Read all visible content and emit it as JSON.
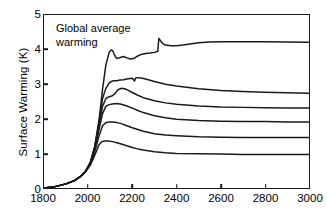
{
  "chart_data": {
    "type": "line",
    "title": "",
    "annotation": "Global average\nwarming",
    "xlabel": "",
    "ylabel": "Surface Warming (K)",
    "xlim": [
      1800,
      3000
    ],
    "ylim": [
      0,
      5
    ],
    "xticks": [
      1800,
      2000,
      2200,
      2400,
      2600,
      2800,
      3000
    ],
    "yticks": [
      0,
      1,
      2,
      3,
      4,
      5
    ],
    "grid": false,
    "legend": "none",
    "line_color": "#1a1a1a",
    "series": [
      {
        "name": "Scenario 1 (highest)",
        "x": [
          1800,
          1850,
          1900,
          1940,
          1970,
          1990,
          2010,
          2030,
          2050,
          2065,
          2080,
          2095,
          2105,
          2112,
          2120,
          2130,
          2145,
          2160,
          2175,
          2190,
          2205,
          2220,
          2240,
          2260,
          2280,
          2300,
          2315,
          2320,
          2325,
          2335,
          2350,
          2375,
          2400,
          2430,
          2460,
          2500,
          2550,
          2600,
          2700,
          2800,
          2900,
          3000
        ],
        "values": [
          0.0,
          0.04,
          0.12,
          0.22,
          0.36,
          0.5,
          0.74,
          1.2,
          2.0,
          2.85,
          3.55,
          3.92,
          3.99,
          3.96,
          3.83,
          3.74,
          3.77,
          3.8,
          3.76,
          3.73,
          3.74,
          3.8,
          3.86,
          3.89,
          3.9,
          3.92,
          3.95,
          4.32,
          4.28,
          4.19,
          4.13,
          4.11,
          4.11,
          4.13,
          4.16,
          4.2,
          4.22,
          4.23,
          4.23,
          4.23,
          4.22,
          4.21
        ]
      },
      {
        "name": "Scenario 2",
        "x": [
          1800,
          1850,
          1900,
          1940,
          1970,
          1990,
          2010,
          2030,
          2050,
          2065,
          2080,
          2095,
          2105,
          2115,
          2130,
          2145,
          2160,
          2180,
          2200,
          2210,
          2215,
          2225,
          2240,
          2260,
          2300,
          2350,
          2400,
          2500,
          2600,
          2700,
          2800,
          2900,
          3000
        ],
        "values": [
          0.0,
          0.04,
          0.12,
          0.22,
          0.36,
          0.5,
          0.74,
          1.2,
          1.95,
          2.58,
          2.88,
          3.03,
          3.08,
          3.1,
          3.1,
          3.12,
          3.13,
          3.16,
          3.17,
          3.09,
          3.18,
          3.19,
          3.18,
          3.15,
          3.08,
          3.0,
          2.95,
          2.87,
          2.82,
          2.79,
          2.77,
          2.75,
          2.74
        ]
      },
      {
        "name": "Scenario 3",
        "x": [
          1800,
          1850,
          1900,
          1940,
          1970,
          1990,
          2010,
          2030,
          2050,
          2065,
          2080,
          2095,
          2108,
          2120,
          2135,
          2150,
          2165,
          2180,
          2200,
          2225,
          2250,
          2300,
          2350,
          2400,
          2500,
          2600,
          2700,
          2800,
          2900,
          3000
        ],
        "values": [
          0.0,
          0.04,
          0.12,
          0.22,
          0.36,
          0.5,
          0.74,
          1.18,
          1.85,
          2.36,
          2.58,
          2.64,
          2.66,
          2.72,
          2.84,
          2.88,
          2.87,
          2.83,
          2.76,
          2.68,
          2.61,
          2.52,
          2.46,
          2.42,
          2.37,
          2.34,
          2.33,
          2.32,
          2.31,
          2.31
        ]
      },
      {
        "name": "Scenario 4",
        "x": [
          1800,
          1850,
          1900,
          1940,
          1970,
          1990,
          2010,
          2030,
          2050,
          2065,
          2080,
          2095,
          2110,
          2130,
          2150,
          2175,
          2200,
          2225,
          2250,
          2300,
          2350,
          2400,
          2500,
          2600,
          2700,
          2800,
          2900,
          3000
        ],
        "values": [
          0.0,
          0.04,
          0.12,
          0.22,
          0.36,
          0.5,
          0.72,
          1.12,
          1.72,
          2.15,
          2.36,
          2.41,
          2.43,
          2.44,
          2.42,
          2.37,
          2.31,
          2.24,
          2.18,
          2.09,
          2.03,
          1.99,
          1.95,
          1.93,
          1.92,
          1.92,
          1.91,
          1.91
        ]
      },
      {
        "name": "Scenario 5",
        "x": [
          1800,
          1850,
          1900,
          1940,
          1970,
          1990,
          2010,
          2030,
          2050,
          2065,
          2080,
          2095,
          2110,
          2130,
          2150,
          2175,
          2200,
          2225,
          2250,
          2300,
          2350,
          2400,
          2500,
          2600,
          2700,
          2800,
          2900,
          3000
        ],
        "values": [
          0.0,
          0.04,
          0.12,
          0.22,
          0.36,
          0.5,
          0.7,
          1.05,
          1.52,
          1.8,
          1.89,
          1.91,
          1.91,
          1.89,
          1.86,
          1.8,
          1.74,
          1.69,
          1.64,
          1.57,
          1.53,
          1.51,
          1.48,
          1.47,
          1.46,
          1.46,
          1.46,
          1.46
        ]
      },
      {
        "name": "Scenario 6 (lowest)",
        "x": [
          1800,
          1850,
          1900,
          1940,
          1970,
          1990,
          2010,
          2030,
          2050,
          2062,
          2075,
          2090,
          2110,
          2130,
          2150,
          2175,
          2200,
          2225,
          2250,
          2300,
          2350,
          2400,
          2500,
          2600,
          2700,
          2800,
          2900,
          3000
        ],
        "values": [
          0.0,
          0.04,
          0.12,
          0.22,
          0.35,
          0.48,
          0.66,
          0.95,
          1.26,
          1.34,
          1.36,
          1.36,
          1.34,
          1.31,
          1.27,
          1.22,
          1.17,
          1.13,
          1.1,
          1.05,
          1.02,
          1.0,
          0.99,
          0.98,
          0.97,
          0.97,
          0.97,
          0.97
        ]
      }
    ]
  }
}
